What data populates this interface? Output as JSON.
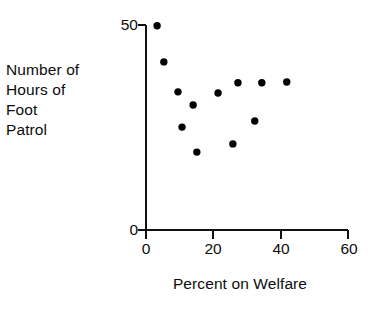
{
  "figure": {
    "ylabel_lines": [
      "Number of",
      "Hours of",
      "Foot",
      "Patrol"
    ],
    "xlabel": "Percent on Welfare",
    "ytick_labels": [
      "50",
      "0"
    ],
    "xtick_labels": [
      "0",
      "20",
      "40",
      "60"
    ],
    "axis_color": "#111111",
    "point_color": "#000000"
  },
  "chart_data": {
    "type": "scatter",
    "title": "",
    "xlabel": "Percent on Welfare",
    "ylabel": "Number of Hours of Foot Patrol",
    "xlim": [
      0,
      60
    ],
    "ylim": [
      0,
      50
    ],
    "xticks": [
      0,
      20,
      40,
      60
    ],
    "yticks": [
      0,
      50
    ],
    "grid": false,
    "legend": null,
    "points": [
      {
        "x": 3.3,
        "y": 49.8
      },
      {
        "x": 5.3,
        "y": 41.0
      },
      {
        "x": 9.5,
        "y": 33.7
      },
      {
        "x": 10.7,
        "y": 25.1
      },
      {
        "x": 14.0,
        "y": 30.5
      },
      {
        "x": 15.1,
        "y": 19.0
      },
      {
        "x": 21.4,
        "y": 33.4
      },
      {
        "x": 25.8,
        "y": 21.0
      },
      {
        "x": 27.3,
        "y": 35.9
      },
      {
        "x": 32.3,
        "y": 26.6
      },
      {
        "x": 34.4,
        "y": 35.9
      },
      {
        "x": 41.8,
        "y": 36.1
      }
    ]
  }
}
